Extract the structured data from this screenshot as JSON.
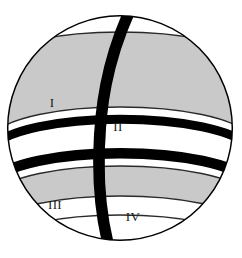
{
  "figure": {
    "type": "sphere-diagram",
    "canvas": {
      "width": 242,
      "height": 258,
      "background": "#ffffff"
    },
    "sphere": {
      "center_x": 120,
      "center_y": 128,
      "radius": 113,
      "outline_color": "#000000",
      "outline_width": 1.4,
      "fill": "#ffffff"
    },
    "colors": {
      "shaded_region": "#c9c9c9",
      "unshaded_region": "#ffffff",
      "band_black": "#000000",
      "outline": "#000000",
      "label_text": "#1a1a1a"
    },
    "labels": [
      {
        "id": "region-1",
        "text": "I",
        "x": 52,
        "y": 104
      },
      {
        "id": "region-2",
        "text": "II",
        "x": 118,
        "y": 128
      },
      {
        "id": "region-3",
        "text": "III",
        "x": 55,
        "y": 206
      },
      {
        "id": "region-4",
        "text": "IV",
        "x": 133,
        "y": 218
      }
    ],
    "latitude_bands": [
      {
        "id": "lat-top-edge",
        "cy": 33,
        "ry": 30,
        "kind": "thin-outline"
      },
      {
        "id": "lat-gray-upper",
        "cy": 62,
        "ry": 36,
        "kind": "gray-start"
      },
      {
        "id": "lat-gray-lower",
        "cy": 137,
        "ry": 52,
        "kind": "gray-end"
      },
      {
        "id": "lat-black-1",
        "cy": 152,
        "ry": 55,
        "kind": "black-band",
        "thickness": 9
      },
      {
        "id": "lat-white-1",
        "cy": 168,
        "ry": 58,
        "kind": "white-band"
      },
      {
        "id": "lat-black-2",
        "cy": 183,
        "ry": 60,
        "kind": "black-band",
        "thickness": 10
      },
      {
        "id": "lat-gray-low-a",
        "cy": 196,
        "ry": 58,
        "kind": "gray-start"
      },
      {
        "id": "lat-gray-low-b",
        "cy": 226,
        "ry": 50,
        "kind": "gray-end"
      },
      {
        "id": "lat-bottom",
        "cy": 244,
        "ry": 38,
        "kind": "thin-outline"
      }
    ],
    "meridian": {
      "id": "meridian-band",
      "description": "thick black great-circle band from north pole to south, tilted",
      "top_x": 128,
      "bottom_x": 100,
      "thickness": 11,
      "color": "#000000"
    },
    "thin_meridian": {
      "id": "thin-meridian-line",
      "description": "faint thin meridian arc behind the thick band",
      "color": "#3a3a3a"
    }
  }
}
